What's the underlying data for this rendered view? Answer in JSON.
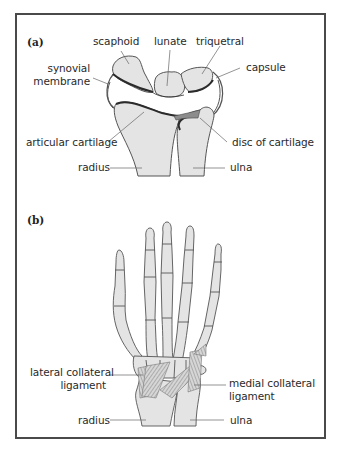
{
  "figure": {
    "panels": [
      {
        "id": "a",
        "label": "(a)",
        "title": "Wrist joint cross-section",
        "labels": {
          "scaphoid": "scaphoid",
          "lunate": "lunate",
          "triquetral": "triquetral",
          "synovial_line1": "synovial",
          "synovial_line2": "membrane",
          "capsule": "capsule",
          "articular_cartilage": "articular cartilage",
          "disc_of_cartilage": "disc of cartilage",
          "radius": "radius",
          "ulna": "ulna"
        }
      },
      {
        "id": "b",
        "label": "(b)",
        "title": "Hand skeleton with wrist ligaments",
        "labels": {
          "lateral_line1": "lateral collateral",
          "lateral_line2": "ligament",
          "medial_line1": "medial collateral",
          "medial_line2": "ligament",
          "radius": "radius",
          "ulna": "ulna"
        }
      }
    ],
    "colors": {
      "frame": "#4a4a4a",
      "bone_fill": "#e4e4e4",
      "bone_stroke": "#555555",
      "cartilage": "#2b2b2b",
      "ligament": "#8a8a8a",
      "leader_line": "#666666",
      "text": "#2a2a2a"
    }
  }
}
